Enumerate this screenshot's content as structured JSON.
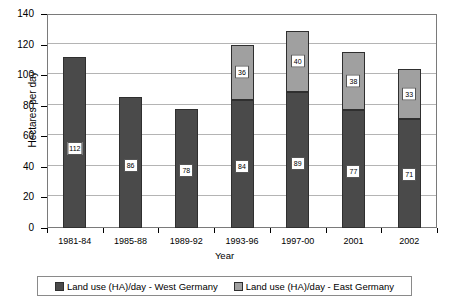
{
  "chart_data": {
    "type": "bar",
    "subtype": "stacked-column",
    "title": "",
    "xlabel": "Year",
    "ylabel": "Hectares per day",
    "ylim": [
      0,
      140
    ],
    "ytick_step": 20,
    "yticks": [
      0,
      20,
      40,
      60,
      80,
      100,
      120,
      140
    ],
    "grid": true,
    "legend_position": "bottom",
    "categories": [
      "1981-84",
      "1985-88",
      "1989-92",
      "1993-96",
      "1997-00",
      "2001",
      "2002"
    ],
    "series": [
      {
        "name": "Land use (HA)/day - West Germany",
        "color": "#4a4a4a",
        "values": [
          112,
          86,
          78,
          84,
          89,
          77,
          71
        ],
        "labels": [
          "112",
          "86",
          "78",
          "84",
          "89",
          "77",
          "71"
        ]
      },
      {
        "name": "Land use (HA)/day - East Germany",
        "color": "#a0a0a0",
        "values": [
          null,
          null,
          null,
          36,
          40,
          38,
          33
        ],
        "labels": [
          "",
          "",
          "",
          "36",
          "40",
          "38",
          "33"
        ]
      }
    ],
    "totals": [
      112,
      86,
      78,
      120,
      129,
      115,
      104
    ]
  },
  "axes": {
    "y_title": "Hectares per day",
    "x_title": "Year",
    "y_tick_labels": [
      "140",
      "120",
      "100",
      "80",
      "60",
      "40",
      "20",
      "0"
    ]
  },
  "legend": {
    "items": [
      {
        "label": "Land use (HA)/day - West Germany",
        "color": "#4a4a4a"
      },
      {
        "label": "Land use (HA)/day - East Germany",
        "color": "#a0a0a0"
      }
    ]
  },
  "colors": {
    "west_germany": "#4a4a4a",
    "east_germany": "#a0a0a0",
    "gridline": "#b4b4b4",
    "axis": "#7a7a7a",
    "background": "#ffffff"
  }
}
